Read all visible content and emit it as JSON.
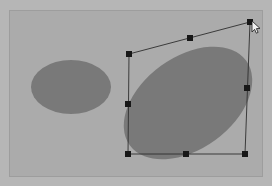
{
  "app": {
    "name": "vector-drawing-canvas",
    "background_color": "#b6b6b6",
    "canvas_color": "#ababab",
    "canvas_border_color": "#9d9d9d"
  },
  "canvas": {
    "x": 10,
    "y": 11,
    "width": 252,
    "height": 165
  },
  "shapes": [
    {
      "id": "ellipse-small",
      "name": "unselected-ellipse",
      "type": "ellipse",
      "cx": 71,
      "cy": 87,
      "rx": 40,
      "ry": 27,
      "rotation": 0,
      "fill": "#797979",
      "selected": false
    },
    {
      "id": "ellipse-large",
      "name": "selected-ellipse",
      "type": "ellipse",
      "cx": 188,
      "cy": 103,
      "rx": 72,
      "ry": 46,
      "rotation": -36,
      "fill": "#797979",
      "selected": true
    }
  ],
  "selection": {
    "name": "skewed-selection-bounds",
    "stroke_color": "#2e2e2e",
    "handle_color": "#171717",
    "handle_size": 6,
    "outline_points": "129,54 250,22 245,154 128,154",
    "handles": [
      {
        "name": "handle-top-left",
        "x": 129,
        "y": 54,
        "role": "corner"
      },
      {
        "name": "handle-top-center",
        "x": 190,
        "y": 38,
        "role": "edge"
      },
      {
        "name": "handle-top-right",
        "x": 250,
        "y": 22,
        "role": "corner"
      },
      {
        "name": "handle-middle-right",
        "x": 247,
        "y": 88,
        "role": "edge"
      },
      {
        "name": "handle-bottom-right",
        "x": 245,
        "y": 154,
        "role": "corner"
      },
      {
        "name": "handle-bottom-center",
        "x": 186,
        "y": 154,
        "role": "edge"
      },
      {
        "name": "handle-bottom-left",
        "x": 128,
        "y": 154,
        "role": "corner"
      },
      {
        "name": "handle-middle-left",
        "x": 128,
        "y": 104,
        "role": "edge"
      }
    ]
  },
  "cursor": {
    "name": "mouse-pointer",
    "x": 252,
    "y": 24,
    "shape": "arrow",
    "fill": "#f2f2f2",
    "stroke": "#1a1a1a"
  }
}
